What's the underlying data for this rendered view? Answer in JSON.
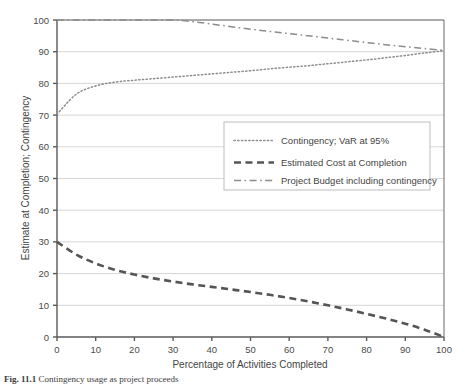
{
  "figure": {
    "caption_label": "Fig. 11.1",
    "caption_text": "Contingency usage as project proceeds"
  },
  "chart_data": {
    "type": "line",
    "title": "",
    "xlabel": "Percentage of Activities Completed",
    "ylabel": "Estimate at Completion; Contingency",
    "xlim": [
      0,
      100
    ],
    "ylim": [
      0,
      100
    ],
    "xticks": [
      0,
      10,
      20,
      30,
      40,
      50,
      60,
      70,
      80,
      90,
      100
    ],
    "yticks": [
      0,
      10,
      20,
      30,
      40,
      50,
      60,
      70,
      80,
      90,
      100
    ],
    "grid": "horizontal",
    "legend_position": "center-right",
    "x": [
      0,
      5,
      10,
      15,
      20,
      25,
      30,
      35,
      40,
      45,
      50,
      55,
      60,
      65,
      70,
      75,
      80,
      85,
      90,
      95,
      100
    ],
    "series": [
      {
        "name": "Contingency; VaR at 95%",
        "style": "dotted",
        "color": "#8c8c8c",
        "values": [
          70.3,
          76.6,
          79.2,
          80.4,
          81.0,
          81.5,
          82.0,
          82.5,
          83.0,
          83.5,
          84.0,
          84.6,
          85.1,
          85.6,
          86.2,
          86.8,
          87.4,
          88.1,
          88.8,
          89.6,
          90.3
        ]
      },
      {
        "name": "Estimated Cost at Completion",
        "style": "dashed",
        "color": "#555555",
        "values": [
          30.0,
          26.0,
          23.2,
          21.2,
          19.7,
          18.5,
          17.5,
          16.6,
          15.8,
          15.0,
          14.2,
          13.3,
          12.3,
          11.2,
          10.0,
          8.7,
          7.3,
          5.8,
          4.2,
          2.3,
          0.0
        ]
      },
      {
        "name": "Project Budget including contingency",
        "style": "dash-dot",
        "color": "#8c8c8c",
        "values": [
          100.0,
          100.0,
          100.0,
          100.0,
          100.0,
          100.0,
          100.0,
          99.5,
          98.7,
          97.9,
          97.1,
          96.4,
          95.7,
          95.0,
          94.3,
          93.6,
          92.9,
          92.2,
          91.6,
          91.0,
          90.4
        ]
      }
    ]
  }
}
